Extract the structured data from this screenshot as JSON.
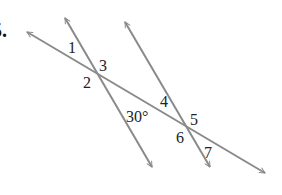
{
  "problem_number": "5.",
  "line_color": "#8a8a8a",
  "text_color": "#222222",
  "lines": [
    {
      "name": "main-line",
      "from": [
        27,
        32
      ],
      "to": [
        265,
        173
      ]
    },
    {
      "name": "left-transversal",
      "from": [
        65,
        18
      ],
      "to": [
        152,
        167
      ]
    },
    {
      "name": "right-transversal",
      "from": [
        125,
        22
      ],
      "to": [
        210,
        167
      ]
    }
  ],
  "intersections": [
    {
      "name": "left",
      "point": [
        92,
        71
      ]
    },
    {
      "name": "right",
      "point": [
        188,
        127
      ]
    }
  ],
  "angle_labels": {
    "a1": "1",
    "a2": "2",
    "a3": "3",
    "a4": "4",
    "a5": "5",
    "a6": "6",
    "a7": "7",
    "given": "30°"
  }
}
